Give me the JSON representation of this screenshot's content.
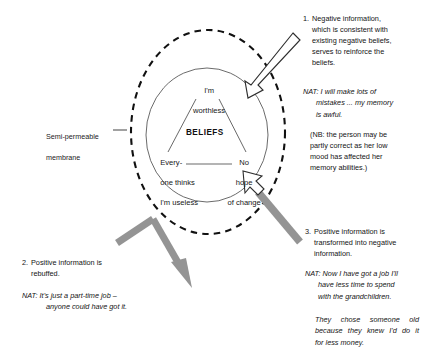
{
  "diagram": {
    "title_semantic": "semi-permeable-membrane-belief-model",
    "colors": {
      "ink": "#141414",
      "circle_stroke": "#4a4a4a",
      "membrane_stroke": "#111111",
      "gray_arrow": "#8e8e8e",
      "white_arrow_fill": "#ffffff",
      "white_arrow_stroke": "#2b2b2b",
      "background": "#ffffff"
    },
    "core": {
      "label": "BELIEFS",
      "top_belief_line1": "I'm",
      "top_belief_line2": "worthless",
      "left_belief_line1": "Every-",
      "left_belief_line2": "one thinks",
      "left_belief_line3": "I'm useless",
      "right_belief_line1": "No",
      "right_belief_line2": "hope",
      "right_belief_line3": "of change"
    },
    "membrane": {
      "label_line1": "Semi-permeable",
      "label_line2": "membrane"
    },
    "notes": [
      {
        "number": "1.",
        "lines": [
          "Negative information,",
          "which is consistent with",
          "existing negative beliefs,",
          "serves to reinforce the",
          "beliefs."
        ]
      },
      {
        "number": "2.",
        "lines": [
          "Positive information is",
          "rebuffed."
        ]
      },
      {
        "number": "3.",
        "lines": [
          "Positive information is",
          "transformed into negative",
          "information."
        ]
      }
    ],
    "nats": {
      "nat1": {
        "tag": "NAT:",
        "lines": [
          "I will make lots of",
          "mistakes ... my memory",
          "is awful."
        ]
      },
      "nat2": {
        "tag": "NAT:",
        "lines": [
          "It's just a part-time job –",
          "anyone could have got it."
        ]
      },
      "nat3": {
        "tag": "NAT:",
        "lines": [
          "Now I have got a job I'll",
          "have less time to spend",
          "with the grandchildren."
        ]
      },
      "nat4": {
        "lines": [
          "They chose someone old",
          "because they knew I'd do it",
          "for less money."
        ]
      }
    },
    "nb": {
      "lines": [
        "(NB: the person may be",
        "partly correct as her low",
        "mood has affected her",
        "memory abilities.)"
      ]
    }
  }
}
